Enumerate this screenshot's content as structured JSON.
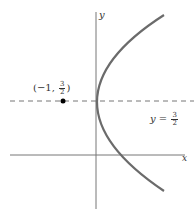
{
  "diagram": {
    "type": "parabola-graph",
    "equation": "x = (4/9)(y - 3/2)^2 - 1",
    "axes": {
      "x_label": "x",
      "y_label": "y"
    },
    "vertex": {
      "label_prefix": "(−1, ",
      "num": "3",
      "den": "2",
      "label_suffix": ")",
      "x": -1,
      "y": 1.5
    },
    "axis_of_symmetry": {
      "label_prefix": "y = ",
      "num": "3",
      "den": "2",
      "style": "dashed"
    },
    "colors": {
      "curve": "#6b6b6b",
      "axes": "#777777",
      "dashed": "#777777",
      "text": "#333333",
      "vertex": "#000000"
    }
  }
}
